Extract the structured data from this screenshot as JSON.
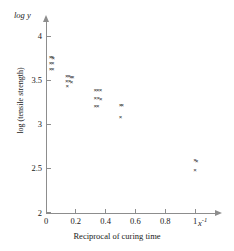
{
  "chart_data": {
    "type": "scatter",
    "title": "",
    "subtitle": "",
    "xlabel": "Reciprocal of curing time",
    "ylabel": "log (tensile strength)",
    "x_axis_symbol": "x",
    "x_axis_symbol_exponent": "-1",
    "y_axis_symbol": "log y",
    "xlim": [
      0,
      1.12
    ],
    "ylim": [
      2,
      4.12
    ],
    "xticks": [
      0,
      0.2,
      0.4,
      0.6,
      0.8,
      1
    ],
    "xtick_labels": [
      "0",
      "0.2",
      "0.4",
      "0.6",
      "0.8",
      "1"
    ],
    "yticks": [
      2,
      2.5,
      3,
      3.5,
      4
    ],
    "ytick_labels": [
      "2",
      "2.5",
      "3",
      "3.5",
      "4"
    ],
    "grid": false,
    "legend": false,
    "marker": "x",
    "marker_color": "#2b2b2b",
    "axis_color": "#8d8d8d",
    "background_color": "#ffffff",
    "points": [
      {
        "x": 0.03,
        "y": 3.76
      },
      {
        "x": 0.042,
        "y": 3.755
      },
      {
        "x": 0.048,
        "y": 3.745
      },
      {
        "x": 0.03,
        "y": 3.69
      },
      {
        "x": 0.045,
        "y": 3.685
      },
      {
        "x": 0.03,
        "y": 3.62
      },
      {
        "x": 0.045,
        "y": 3.615
      },
      {
        "x": 0.14,
        "y": 3.545
      },
      {
        "x": 0.155,
        "y": 3.54
      },
      {
        "x": 0.168,
        "y": 3.535
      },
      {
        "x": 0.18,
        "y": 3.53
      },
      {
        "x": 0.14,
        "y": 3.485
      },
      {
        "x": 0.158,
        "y": 3.48
      },
      {
        "x": 0.172,
        "y": 3.478
      },
      {
        "x": 0.142,
        "y": 3.43
      },
      {
        "x": 0.33,
        "y": 3.385
      },
      {
        "x": 0.348,
        "y": 3.382
      },
      {
        "x": 0.366,
        "y": 3.38
      },
      {
        "x": 0.33,
        "y": 3.29
      },
      {
        "x": 0.35,
        "y": 3.288
      },
      {
        "x": 0.368,
        "y": 3.285
      },
      {
        "x": 0.33,
        "y": 3.2
      },
      {
        "x": 0.348,
        "y": 3.198
      },
      {
        "x": 0.5,
        "y": 3.215
      },
      {
        "x": 0.512,
        "y": 3.212
      },
      {
        "x": 0.5,
        "y": 3.08
      },
      {
        "x": 1.0,
        "y": 2.585
      },
      {
        "x": 1.012,
        "y": 2.578
      },
      {
        "x": 1.0,
        "y": 2.48
      }
    ]
  }
}
